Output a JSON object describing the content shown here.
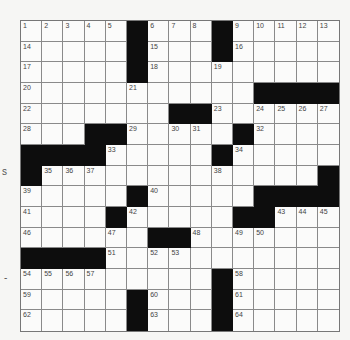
{
  "puzzle": {
    "rows": 15,
    "cols": 15,
    "colors": {
      "black": "#0d0d0d",
      "white": "#fbfbfa",
      "line": "#8a8a8a",
      "number": "#444444"
    },
    "grid": [
      [
        {
          "n": "1"
        },
        {
          "n": "2"
        },
        {
          "n": "3"
        },
        {
          "n": "4"
        },
        {
          "n": "5"
        },
        {
          "b": 1
        },
        {
          "n": "6"
        },
        {
          "n": "7"
        },
        {
          "n": "8"
        },
        {
          "b": 1
        },
        {
          "n": "9"
        },
        {
          "n": "10"
        },
        {
          "n": "11"
        },
        {
          "n": "12"
        },
        {
          "n": "13"
        }
      ],
      [
        {
          "n": "14"
        },
        {},
        {},
        {},
        {},
        {
          "b": 1
        },
        {
          "n": "15"
        },
        {},
        {},
        {
          "b": 1
        },
        {
          "n": "16"
        },
        {},
        {},
        {},
        {}
      ],
      [
        {
          "n": "17"
        },
        {},
        {},
        {},
        {},
        {
          "b": 1
        },
        {
          "n": "18"
        },
        {},
        {},
        {
          "n": "19"
        },
        {},
        {},
        {},
        {},
        {}
      ],
      [
        {
          "n": "20"
        },
        {},
        {},
        {},
        {},
        {
          "n": "21"
        },
        {},
        {},
        {},
        {},
        {},
        {
          "b": 1
        },
        {
          "b": 1
        },
        {
          "b": 1
        },
        {
          "b": 1
        }
      ],
      [
        {
          "n": "22"
        },
        {},
        {},
        {},
        {},
        {},
        {},
        {
          "b": 1
        },
        {
          "b": 1
        },
        {
          "n": "23"
        },
        {},
        {
          "n": "24"
        },
        {
          "n": "25"
        },
        {
          "n": "26"
        },
        {
          "n": "27"
        }
      ],
      [
        {
          "n": "28"
        },
        {},
        {},
        {
          "b": 1
        },
        {
          "b": 1
        },
        {
          "n": "29"
        },
        {},
        {
          "n": "30"
        },
        {
          "n": "31"
        },
        {},
        {
          "b": 1
        },
        {
          "n": "32"
        },
        {},
        {},
        {}
      ],
      [
        {
          "b": 1
        },
        {
          "b": 1
        },
        {
          "b": 1
        },
        {
          "b": 1
        },
        {
          "n": "33"
        },
        {},
        {},
        {},
        {},
        {
          "b": 1
        },
        {
          "n": "34"
        },
        {},
        {},
        {},
        {}
      ],
      [
        {
          "b": 1
        },
        {
          "n": "35"
        },
        {
          "n": "36"
        },
        {
          "n": "37"
        },
        {},
        {},
        {},
        {},
        {},
        {
          "n": "38"
        },
        {},
        {},
        {},
        {},
        {
          "b": 1
        }
      ],
      [
        {
          "n": "39"
        },
        {},
        {},
        {},
        {},
        {
          "b": 1
        },
        {
          "n": "40"
        },
        {},
        {},
        {},
        {},
        {
          "b": 1
        },
        {
          "b": 1
        },
        {
          "b": 1
        },
        {
          "b": 1
        }
      ],
      [
        {
          "n": "41"
        },
        {},
        {},
        {},
        {
          "b": 1
        },
        {
          "n": "42"
        },
        {},
        {},
        {},
        {},
        {
          "b": 1
        },
        {
          "b": 1
        },
        {
          "n": "43"
        },
        {
          "n": "44"
        },
        {
          "n": "45"
        }
      ],
      [
        {
          "n": "46"
        },
        {},
        {},
        {},
        {
          "n": "47"
        },
        {},
        {
          "b": 1
        },
        {
          "b": 1
        },
        {
          "n": "48"
        },
        {},
        {
          "n": "49"
        },
        {
          "n": "50"
        },
        {},
        {},
        {}
      ],
      [
        {
          "b": 1
        },
        {
          "b": 1
        },
        {
          "b": 1
        },
        {
          "b": 1
        },
        {
          "n": "51"
        },
        {},
        {
          "n": "52"
        },
        {
          "n": "53"
        },
        {},
        {},
        {},
        {},
        {},
        {},
        {}
      ],
      [
        {
          "n": "54"
        },
        {
          "n": "55"
        },
        {
          "n": "56"
        },
        {
          "n": "57"
        },
        {},
        {},
        {},
        {},
        {},
        {
          "b": 1
        },
        {
          "n": "58"
        },
        {},
        {},
        {},
        {}
      ],
      [
        {
          "n": "59"
        },
        {},
        {},
        {},
        {},
        {
          "b": 1
        },
        {
          "n": "60"
        },
        {},
        {},
        {
          "b": 1
        },
        {
          "n": "61"
        },
        {},
        {},
        {},
        {}
      ],
      [
        {
          "n": "62"
        },
        {},
        {},
        {},
        {},
        {
          "b": 1
        },
        {
          "n": "63"
        },
        {},
        {},
        {
          "b": 1
        },
        {
          "n": "64"
        },
        {},
        {},
        {},
        {}
      ]
    ]
  },
  "edge_fragments": [
    {
      "text": "s",
      "x": 2,
      "y": 166
    },
    {
      "text": "-",
      "x": 4,
      "y": 272
    }
  ]
}
